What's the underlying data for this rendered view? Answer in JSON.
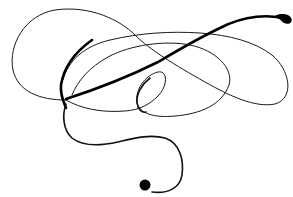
{
  "image": {
    "subject": "calligraphic flourish",
    "description": "A single continuous black ink swash with looping curves on a white background, ending in ball terminals at top-right and bottom-center.",
    "colors": {
      "background": "#ffffff",
      "ink": "#000000"
    },
    "elements": [
      {
        "name": "top-right-terminal",
        "shape": "ink blob"
      },
      {
        "name": "bottom-terminal",
        "shape": "ink ball"
      },
      {
        "name": "large-left-loop",
        "shape": "open loop"
      },
      {
        "name": "large-right-loop",
        "shape": "elongated loop"
      },
      {
        "name": "small-center-loop",
        "shape": "small oval loop"
      },
      {
        "name": "descending-tail",
        "shape": "S-curve tail"
      }
    ]
  }
}
